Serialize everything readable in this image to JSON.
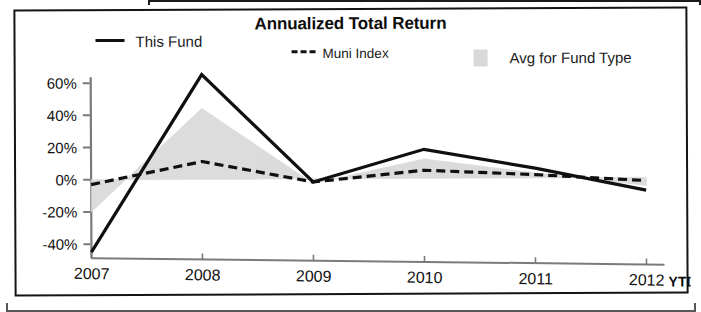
{
  "chart_data": {
    "type": "line",
    "title": "Annualized Total Return",
    "xlabel": "",
    "ylabel": "",
    "x": [
      "2007",
      "2008",
      "2009",
      "2010",
      "2011",
      "2012"
    ],
    "categories": [
      "2007",
      "2008",
      "2009",
      "2010",
      "2011",
      "2012"
    ],
    "x_axis_note": "YTD",
    "ylim": [
      -50,
      70
    ],
    "yticks": [
      60,
      40,
      20,
      0,
      -20,
      -40
    ],
    "ytick_labels": [
      "60%",
      "40%",
      "20%",
      "0%",
      "-20%",
      "-40%"
    ],
    "grid": false,
    "legend_position": "top",
    "series": [
      {
        "name": "This Fund",
        "style": "solid",
        "color": "#101010",
        "values": [
          -45,
          65,
          -2,
          18,
          6,
          -8
        ]
      },
      {
        "name": "Muni Index",
        "style": "dashed",
        "color": "#101010",
        "values": [
          -3,
          11,
          -2,
          5,
          2,
          -2
        ]
      },
      {
        "name": "Avg for Fund Type",
        "style": "area",
        "color": "#d9d9d9",
        "values": [
          -20,
          44,
          -3,
          12,
          3,
          -5
        ]
      }
    ]
  },
  "legend": {
    "this_fund": "This Fund",
    "muni_index": "Muni Index",
    "avg_fund_type": "Avg for Fund Type",
    "muni_prefix": "---"
  },
  "axis": {
    "y_labels": [
      "60%",
      "40%",
      "20%",
      "0%",
      "-20%",
      "-40%"
    ],
    "x_labels": [
      "2007",
      "2008",
      "2009",
      "2010",
      "2011",
      "2012"
    ],
    "ytd": "YTD"
  },
  "colors": {
    "line": "#101010",
    "area": "#d9d9d9",
    "axis": "#7a7a7a",
    "border": "#141414",
    "text": "#111111"
  }
}
